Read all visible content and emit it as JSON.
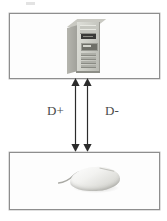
{
  "diagram": {
    "background_color": "#ffffff",
    "border_color": "#8e8e8e",
    "line_color": "#2b2b2b",
    "label_color": "#4a4a4a",
    "panels": [
      {
        "id": "host",
        "name": "host-computer-panel",
        "content_icon": "computer-tower-icon",
        "content_label": "Computer tower"
      },
      {
        "id": "device",
        "name": "device-panel",
        "content_icon": "computer-mouse-icon",
        "content_label": "Computer mouse"
      }
    ],
    "connections": [
      {
        "id": "dplus",
        "label": "D+",
        "icon": "double-headed-arrow-icon",
        "direction": "bidirectional"
      },
      {
        "id": "dminus",
        "label": "D-",
        "icon": "double-headed-arrow-icon",
        "direction": "bidirectional"
      }
    ],
    "artifact": {
      "name": "scan-artifact",
      "visible": true
    }
  }
}
